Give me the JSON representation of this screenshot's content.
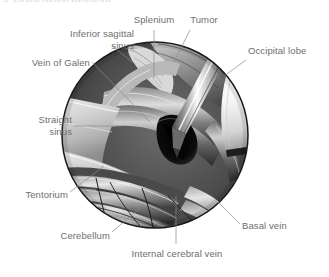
{
  "figure": {
    "type": "anatomical-surgical-illustration",
    "cut_off_caption_top": "a. Pineal region exposure",
    "view": {
      "shape": "circle",
      "description": "Circular operative microscope field of view showing midline supracerebellar / pineal region with tumor, retractor and surgical instrument"
    },
    "colors": {
      "label_text": "#6e6e6e",
      "leader_line": "#8a8a8a",
      "circle_outline": "#1a1a1a",
      "background": "#ffffff",
      "retractor": "#f2f2f2",
      "tentorium": "#cfcfcf",
      "tissue_dark": "#3a3a3a",
      "cavity": "#111111"
    },
    "labels": [
      {
        "id": "inferior-sagittal-sinus",
        "text": "Inferior sagittal\nsinus",
        "line1": "Inferior sagittal",
        "line2": "sinus",
        "align": "right",
        "x": 38,
        "y": 28,
        "width": 96
      },
      {
        "id": "splenium",
        "text": "Splenium",
        "align": "center",
        "x": 130,
        "y": 14,
        "width": 48
      },
      {
        "id": "tumor",
        "text": "Tumor",
        "align": "center",
        "x": 186,
        "y": 14,
        "width": 36
      },
      {
        "id": "occipital-lobe",
        "text": "Occipital lobe",
        "align": "left",
        "x": 248,
        "y": 45,
        "width": 70
      },
      {
        "id": "vein-of-galen",
        "text": "Vein of Galen",
        "align": "right",
        "x": 20,
        "y": 57,
        "width": 70
      },
      {
        "id": "straight-sinus",
        "text": "Straight\nsinus",
        "line1": "Straight",
        "line2": "sinus",
        "align": "right",
        "x": 16,
        "y": 114,
        "width": 56
      },
      {
        "id": "tentorium",
        "text": "Tentorium",
        "align": "right",
        "x": 12,
        "y": 189,
        "width": 56
      },
      {
        "id": "cerebellum",
        "text": "Cerebellum",
        "align": "right",
        "x": 48,
        "y": 230,
        "width": 62
      },
      {
        "id": "internal-cerebral-vein",
        "text": "Internal cerebral vein",
        "align": "center",
        "x": 118,
        "y": 248,
        "width": 118
      },
      {
        "id": "basal-vein",
        "text": "Basal vein",
        "align": "left",
        "x": 242,
        "y": 220,
        "width": 58
      }
    ],
    "structures": [
      "inferior sagittal sinus",
      "splenium of corpus callosum",
      "tumor",
      "occipital lobe",
      "vein of Galen",
      "straight sinus",
      "tentorium",
      "cerebellum",
      "internal cerebral vein",
      "basal vein"
    ],
    "instruments": [
      "brain retractor blade",
      "suction / bipolar instrument"
    ]
  }
}
